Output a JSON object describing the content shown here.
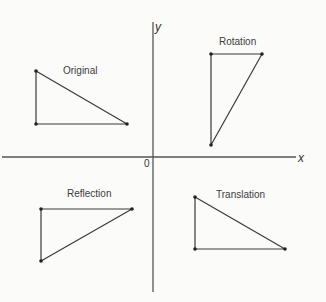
{
  "diagram": {
    "axes": {
      "x_label": "x",
      "y_label": "y",
      "origin_label": "0",
      "color": "#555555"
    },
    "shapes": [
      {
        "id": "original",
        "label": "Original",
        "points": [
          [
            36,
            71
          ],
          [
            36,
            124
          ],
          [
            127,
            124
          ]
        ]
      },
      {
        "id": "rotation",
        "label": "Rotation",
        "points": [
          [
            211,
            54
          ],
          [
            262,
            54
          ],
          [
            211,
            145
          ]
        ]
      },
      {
        "id": "reflection",
        "label": "Reflection",
        "points": [
          [
            41,
            209
          ],
          [
            132,
            209
          ],
          [
            41,
            261
          ]
        ]
      },
      {
        "id": "translation",
        "label": "Translation",
        "points": [
          [
            195,
            197
          ],
          [
            195,
            249
          ],
          [
            285,
            249
          ]
        ]
      }
    ],
    "stroke_color": "#3a3a3a",
    "background_color": "#fbfbfa"
  }
}
